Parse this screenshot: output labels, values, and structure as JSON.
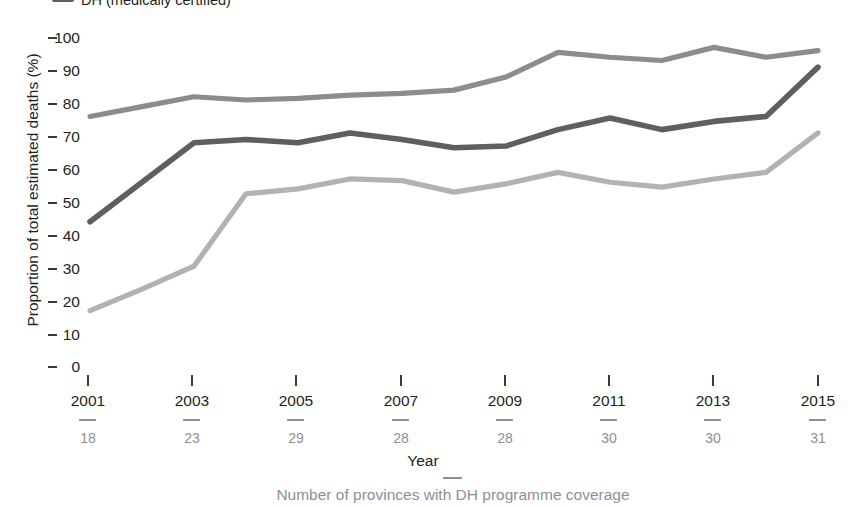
{
  "legend": {
    "items": [
      {
        "label": "DH (medically certified)",
        "color": "#5f5f5f",
        "swatch": "line-swatch"
      }
    ]
  },
  "axes": {
    "ylabel": "Proportion of total estimated deaths (%)",
    "xlabel": "Year",
    "x_sub_label": "Number of provinces with DH programme coverage"
  },
  "chart_data": {
    "type": "line",
    "title": "",
    "xlabel": "Year",
    "ylabel": "Proportion of total estimated deaths (%)",
    "ylim": [
      0,
      100
    ],
    "yticks": [
      0,
      10,
      20,
      30,
      40,
      50,
      60,
      70,
      80,
      90,
      100
    ],
    "grid": false,
    "legend_position": "top-left",
    "x": [
      2001,
      2002,
      2003,
      2004,
      2005,
      2006,
      2007,
      2008,
      2009,
      2010,
      2011,
      2012,
      2013,
      2014,
      2015
    ],
    "xtick_labels": [
      "2001",
      "2003",
      "2005",
      "2007",
      "2009",
      "2011",
      "2013",
      "2015"
    ],
    "xtick_values": [
      2001,
      2003,
      2005,
      2007,
      2009,
      2011,
      2013,
      2015
    ],
    "secondary_xaxis": {
      "label": "Number of provinces with DH programme coverage",
      "values": [
        18,
        23,
        29,
        28,
        28,
        30,
        30,
        31
      ]
    },
    "series": [
      {
        "name": "Upper line",
        "color": "#8c8c8c",
        "values": [
          76,
          79,
          82,
          81,
          81.5,
          82.5,
          83,
          84,
          88,
          95.5,
          94,
          93,
          97,
          94,
          96
        ]
      },
      {
        "name": "DH (medically certified)",
        "color": "#5f5f5f",
        "values": [
          44,
          56,
          68,
          69,
          68,
          71,
          69,
          66.5,
          67,
          72,
          75.5,
          72,
          74.5,
          76,
          91
        ]
      },
      {
        "name": "Lower line",
        "color": "#b0b2b4",
        "values": [
          17,
          23.5,
          30.5,
          52.5,
          54,
          57,
          56.5,
          53,
          55.5,
          59,
          56,
          54.5,
          57,
          59,
          71
        ]
      }
    ]
  }
}
